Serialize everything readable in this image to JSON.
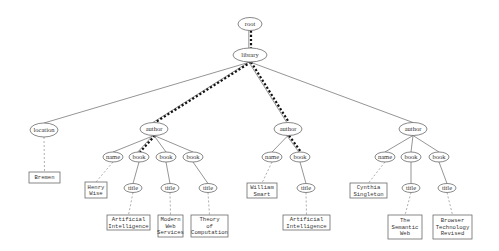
{
  "diagram": {
    "type": "xml-tree",
    "width": 499,
    "height": 251,
    "colors": {
      "edge": "#7a7a7a",
      "highlight_path": "#111111",
      "node_stroke": "#6a6a6a"
    },
    "element_nodes": [
      {
        "id": "root",
        "label": "root",
        "cx": 250,
        "cy": 24,
        "rx": 12,
        "ry": 6.5
      },
      {
        "id": "library",
        "label": "library",
        "cx": 250,
        "cy": 55,
        "rx": 17,
        "ry": 7
      },
      {
        "id": "location",
        "label": "location",
        "cx": 44,
        "cy": 130,
        "rx": 14,
        "ry": 7
      },
      {
        "id": "author1",
        "label": "author",
        "cx": 154,
        "cy": 129,
        "rx": 14,
        "ry": 6.5
      },
      {
        "id": "name1",
        "label": "name",
        "cx": 113,
        "cy": 157,
        "rx": 10,
        "ry": 5
      },
      {
        "id": "book1a",
        "label": "book",
        "cx": 139,
        "cy": 157,
        "rx": 10,
        "ry": 5
      },
      {
        "id": "book1b",
        "label": "book",
        "cx": 166,
        "cy": 157,
        "rx": 10,
        "ry": 5
      },
      {
        "id": "book1c",
        "label": "book",
        "cx": 193,
        "cy": 157,
        "rx": 10,
        "ry": 5
      },
      {
        "id": "title1a",
        "label": "title",
        "cx": 133,
        "cy": 188,
        "rx": 9,
        "ry": 4.5
      },
      {
        "id": "title1b",
        "label": "title",
        "cx": 170,
        "cy": 188,
        "rx": 9,
        "ry": 4.5
      },
      {
        "id": "title1c",
        "label": "title",
        "cx": 208,
        "cy": 188,
        "rx": 9,
        "ry": 4.5
      },
      {
        "id": "author2",
        "label": "author",
        "cx": 288,
        "cy": 129,
        "rx": 14,
        "ry": 6.5
      },
      {
        "id": "name2",
        "label": "name",
        "cx": 272,
        "cy": 157,
        "rx": 10,
        "ry": 5
      },
      {
        "id": "book2a",
        "label": "book",
        "cx": 300,
        "cy": 157,
        "rx": 10,
        "ry": 5
      },
      {
        "id": "title2a",
        "label": "title",
        "cx": 306,
        "cy": 188,
        "rx": 9,
        "ry": 4.5
      },
      {
        "id": "author3",
        "label": "author",
        "cx": 413,
        "cy": 129,
        "rx": 14,
        "ry": 6.5
      },
      {
        "id": "name3",
        "label": "name",
        "cx": 385,
        "cy": 157,
        "rx": 10,
        "ry": 5
      },
      {
        "id": "book3a",
        "label": "book",
        "cx": 411,
        "cy": 157,
        "rx": 10,
        "ry": 5
      },
      {
        "id": "book3b",
        "label": "book",
        "cx": 439,
        "cy": 157,
        "rx": 10,
        "ry": 5
      },
      {
        "id": "title3a",
        "label": "title",
        "cx": 411,
        "cy": 188,
        "rx": 9,
        "ry": 4.5
      },
      {
        "id": "title3b",
        "label": "title",
        "cx": 447,
        "cy": 188,
        "rx": 9,
        "ry": 4.5
      }
    ],
    "text_nodes": [
      {
        "id": "t_bremen",
        "lines": [
          "Bremen"
        ],
        "x": 29,
        "y": 172,
        "w": 31,
        "h": 11
      },
      {
        "id": "t_henry",
        "lines": [
          "Henry",
          "Wise"
        ],
        "x": 85,
        "y": 182,
        "w": 22,
        "h": 16
      },
      {
        "id": "t_ai1",
        "lines": [
          "Artificial",
          "Intelligence"
        ],
        "x": 107,
        "y": 215,
        "w": 43,
        "h": 15
      },
      {
        "id": "t_mws",
        "lines": [
          "Modern",
          "Web",
          "Services"
        ],
        "x": 158,
        "y": 215,
        "w": 25,
        "h": 22
      },
      {
        "id": "t_toc",
        "lines": [
          "Theory",
          "of",
          "Computation"
        ],
        "x": 191,
        "y": 215,
        "w": 37,
        "h": 22
      },
      {
        "id": "t_william",
        "lines": [
          "William",
          "Smart"
        ],
        "x": 247,
        "y": 183,
        "w": 30,
        "h": 15
      },
      {
        "id": "t_ai2",
        "lines": [
          "Artificial",
          "Intelligence"
        ],
        "x": 283,
        "y": 215,
        "w": 47,
        "h": 15
      },
      {
        "id": "t_cynthia",
        "lines": [
          "Cynthia",
          "Singleton"
        ],
        "x": 350,
        "y": 183,
        "w": 37,
        "h": 15
      },
      {
        "id": "t_sw",
        "lines": [
          "The",
          "Semantic",
          "Web"
        ],
        "x": 388,
        "y": 215,
        "w": 34,
        "h": 24
      },
      {
        "id": "t_btr",
        "lines": [
          "Browser",
          "Technology",
          "Revised"
        ],
        "x": 433,
        "y": 215,
        "w": 39,
        "h": 24
      }
    ],
    "edges": [
      {
        "from": "root",
        "to": "library",
        "style": "path"
      },
      {
        "from": "library",
        "to": "location",
        "style": "solid"
      },
      {
        "from": "library",
        "to": "author1",
        "style": "path"
      },
      {
        "from": "library",
        "to": "author2",
        "style": "path"
      },
      {
        "from": "library",
        "to": "author3",
        "style": "solid"
      },
      {
        "from": "location",
        "to": "t_bremen",
        "style": "dotted"
      },
      {
        "from": "author1",
        "to": "name1",
        "style": "solid"
      },
      {
        "from": "author1",
        "to": "book1a",
        "style": "path"
      },
      {
        "from": "author1",
        "to": "book1b",
        "style": "solid"
      },
      {
        "from": "author1",
        "to": "book1c",
        "style": "solid"
      },
      {
        "from": "name1",
        "to": "t_henry",
        "style": "dotted"
      },
      {
        "from": "book1a",
        "to": "title1a",
        "style": "solid"
      },
      {
        "from": "book1b",
        "to": "title1b",
        "style": "solid"
      },
      {
        "from": "book1c",
        "to": "title1c",
        "style": "solid"
      },
      {
        "from": "title1a",
        "to": "t_ai1",
        "style": "dotted"
      },
      {
        "from": "title1b",
        "to": "t_mws",
        "style": "dotted"
      },
      {
        "from": "title1c",
        "to": "t_toc",
        "style": "dotted"
      },
      {
        "from": "author2",
        "to": "name2",
        "style": "solid"
      },
      {
        "from": "author2",
        "to": "book2a",
        "style": "path"
      },
      {
        "from": "name2",
        "to": "t_william",
        "style": "dotted"
      },
      {
        "from": "book2a",
        "to": "title2a",
        "style": "solid"
      },
      {
        "from": "title2a",
        "to": "t_ai2",
        "style": "dotted"
      },
      {
        "from": "author3",
        "to": "name3",
        "style": "solid"
      },
      {
        "from": "author3",
        "to": "book3a",
        "style": "solid"
      },
      {
        "from": "author3",
        "to": "book3b",
        "style": "solid"
      },
      {
        "from": "name3",
        "to": "t_cynthia",
        "style": "dotted"
      },
      {
        "from": "book3a",
        "to": "title3a",
        "style": "solid"
      },
      {
        "from": "book3b",
        "to": "title3b",
        "style": "solid"
      },
      {
        "from": "title3a",
        "to": "t_sw",
        "style": "dotted"
      },
      {
        "from": "title3b",
        "to": "t_btr",
        "style": "dotted"
      }
    ]
  }
}
